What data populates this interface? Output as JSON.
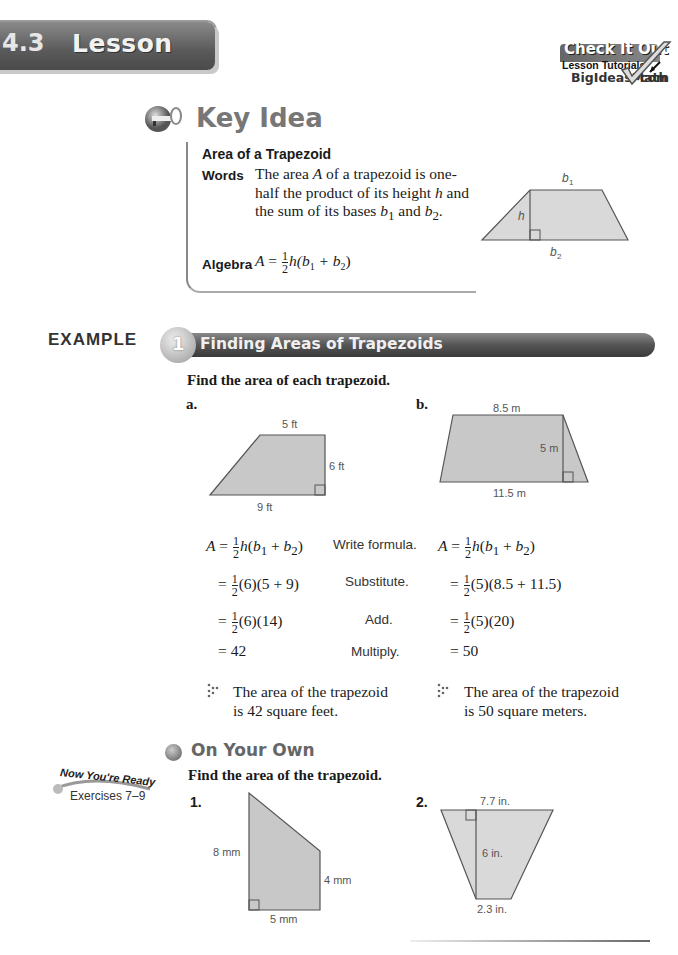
{
  "header": {
    "lesson_number": "4.3",
    "lesson_word": "Lesson",
    "check_it_out": {
      "title": "Check It Out",
      "subtitle": "Lesson Tutorials",
      "site": "BigIdeasMath",
      "site_suffix": "com"
    }
  },
  "key_idea": {
    "heading": "Key Idea",
    "title": "Area of a Trapezoid",
    "words_label": "Words",
    "words_parts": [
      "The area ",
      "A",
      " of a trapezoid is one-half the product of its height ",
      "h",
      " and the sum of its bases ",
      "b",
      "1",
      " and ",
      "b",
      "2",
      "."
    ],
    "algebra_label": "Algebra",
    "formula": {
      "lhs": "A",
      "eq": "=",
      "frac_num": "1",
      "frac_den": "2",
      "rest": "h(b",
      "sub1": "1",
      "plus": " + b",
      "sub2": "2",
      "close": ")"
    },
    "diagram_labels": {
      "top": "b",
      "top_sub": "1",
      "height": "h",
      "bottom": "b",
      "bottom_sub": "2"
    }
  },
  "example": {
    "label": "EXAMPLE",
    "number": "1",
    "title": "Finding Areas of Trapezoids",
    "instruction": "Find the area of each trapezoid.",
    "part_a": {
      "label": "a.",
      "fig_labels": {
        "top": "5 ft",
        "height": "6 ft",
        "bottom": "9 ft"
      },
      "steps": [
        {
          "expr_pre": "A = ",
          "frac": true,
          "expr": "h(b",
          "tail": "formula",
          "reason": "Write formula."
        },
        {
          "expr_pre": "= ",
          "frac": true,
          "expr": "(6)(5 + 9)",
          "reason": "Substitute."
        },
        {
          "expr_pre": "= ",
          "frac": true,
          "expr": "(6)(14)",
          "reason": "Add."
        },
        {
          "expr_pre": "= ",
          "frac": false,
          "expr": "42",
          "reason": "Multiply."
        }
      ],
      "result_line1": "The area of the trapezoid",
      "result_line2": "is 42 square feet."
    },
    "part_b": {
      "label": "b.",
      "fig_labels": {
        "top": "8.5 m",
        "height": "5 m",
        "bottom": "11.5 m"
      },
      "steps": [
        {
          "expr_pre": "A = ",
          "frac": true,
          "expr": "h(b",
          "tail": "formula"
        },
        {
          "expr_pre": "= ",
          "frac": true,
          "expr": "(5)(8.5 + 11.5)"
        },
        {
          "expr_pre": "= ",
          "frac": true,
          "expr": "(5)(20)"
        },
        {
          "expr_pre": "= ",
          "frac": false,
          "expr": "50"
        }
      ],
      "result_line1": "The area of the trapezoid",
      "result_line2": "is 50 square meters."
    }
  },
  "on_your_own": {
    "heading": "On Your Own",
    "ready_title": "Now You're Ready",
    "ready_exercises": "Exercises 7–9",
    "instruction": "Find the area of the trapezoid.",
    "exercises": [
      {
        "label": "1.",
        "fig_labels": {
          "left": "8 mm",
          "right": "4 mm",
          "bottom": "5 mm"
        }
      },
      {
        "label": "2.",
        "fig_labels": {
          "top": "7.7 in.",
          "height": "6 in.",
          "bottom": "2.3 in."
        }
      }
    ]
  }
}
